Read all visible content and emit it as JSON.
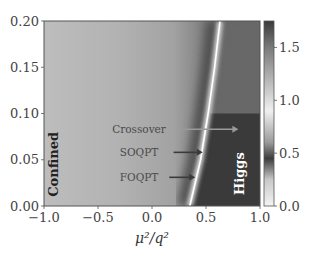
{
  "chart_data": {
    "type": "heatmap",
    "title": "",
    "xlabel": "μ²/q²",
    "ylabel": "",
    "xlim": [
      -1.0,
      1.0
    ],
    "ylim": [
      0.0,
      0.2
    ],
    "x_ticks": [
      "−1.0",
      "−0.5",
      "0.0",
      "0.5",
      "1.0"
    ],
    "x_tick_values": [
      -1.0,
      -0.5,
      0.0,
      0.5,
      1.0
    ],
    "y_ticks": [
      "0.00",
      "0.05",
      "0.10",
      "0.15",
      "0.20"
    ],
    "y_tick_values": [
      0.0,
      0.05,
      0.1,
      0.15,
      0.2
    ],
    "grid": false,
    "colormap": "grayscale-nonmonotonic",
    "colorbar": {
      "range": [
        0.0,
        1.75
      ],
      "ticks": [
        "0.0",
        "0.5",
        "1.0",
        "1.5"
      ],
      "tick_values": [
        0.0,
        0.5,
        1.0,
        1.5
      ],
      "stops": [
        {
          "value": 0.0,
          "color": "#f4f4f4"
        },
        {
          "value": 0.25,
          "color": "#c8c8c8"
        },
        {
          "value": 0.45,
          "color": "#3c3c3c"
        },
        {
          "value": 0.6,
          "color": "#9a9a9a"
        },
        {
          "value": 0.9,
          "color": "#f0f0f0"
        },
        {
          "value": 1.2,
          "color": "#b4b4b4"
        },
        {
          "value": 1.5,
          "color": "#7a7a7a"
        },
        {
          "value": 1.75,
          "color": "#3a3a3a"
        }
      ]
    },
    "boundary_line": {
      "description": "phase transition ridge",
      "points": [
        [
          0.35,
          0.0
        ],
        [
          0.45,
          0.05
        ],
        [
          0.52,
          0.1
        ],
        [
          0.58,
          0.15
        ],
        [
          0.63,
          0.2
        ]
      ]
    },
    "regions": [
      {
        "label": "Confined",
        "x": -0.87,
        "y": 0.045,
        "color": "#222222"
      },
      {
        "label": "Higgs",
        "x": 0.85,
        "y": 0.035,
        "color": "#ffffff"
      }
    ],
    "annotations": [
      {
        "label": "Crossover",
        "text_x": -0.12,
        "y": 0.083,
        "arrow_from": 0.27,
        "arrow_to": 0.8,
        "color": "#9a9a9a"
      },
      {
        "label": "SOQPT",
        "text_x": -0.12,
        "y": 0.058,
        "arrow_from": 0.2,
        "arrow_to": 0.47,
        "color": "#3a3a3a"
      },
      {
        "label": "FOQPT",
        "text_x": -0.12,
        "y": 0.031,
        "arrow_from": 0.16,
        "arrow_to": 0.4,
        "color": "#3a3a3a"
      }
    ]
  }
}
